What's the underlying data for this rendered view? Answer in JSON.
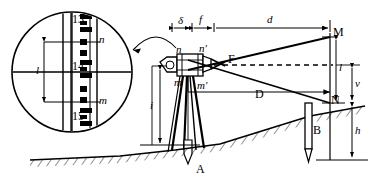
{
  "figure": {
    "type": "engineering-diagram",
    "background": "#ffffff",
    "ink": "#000000"
  },
  "telescope_view": {
    "name": "reticle-circle-view",
    "staff_numbers": [
      "13",
      "14",
      "15"
    ],
    "labels": {
      "upper_stadia": "n",
      "lower_stadia": "m",
      "stadia_interval": "l"
    }
  },
  "instrument": {
    "name": "tacheometer-telescope",
    "labels": {
      "upper_reticle": "n",
      "lower_reticle": "m",
      "upper_object_ray": "n'",
      "lower_object_ray": "m'",
      "focus": "F",
      "instrument_height": "i"
    }
  },
  "dimensions": {
    "delta": "δ",
    "focal_length": "f",
    "slope_distance": "d",
    "horizontal_distance": "D",
    "staff_interval": "l",
    "vertical_offset": "v",
    "staff_height": "h"
  },
  "stations": {
    "instrument_point": "A",
    "staff_point": "B",
    "upper_target": "M",
    "lower_target": "N"
  }
}
